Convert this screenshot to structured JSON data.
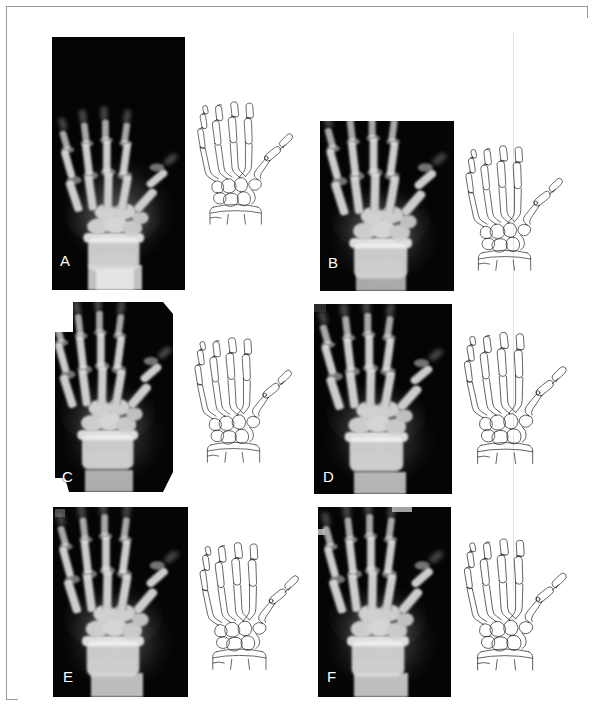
{
  "figure": {
    "kind": "radiograph-tracing-figure",
    "panel_count": 6,
    "background_color": "#ffffff",
    "frame_color": "#9a9a9a",
    "film_color": "#000000",
    "tracing_ink_color": "#1a1a1a",
    "label_color": "#ffffff"
  },
  "panels": [
    {
      "id": "A",
      "label": "A",
      "xray": {
        "x": 45,
        "y": 30,
        "width": 133,
        "height": 253,
        "shape": "rect"
      },
      "tracing": {
        "x": 181,
        "y": 32,
        "width": 110,
        "height": 248
      },
      "label_pos": {
        "x": 53,
        "y": 258
      }
    },
    {
      "id": "B",
      "label": "B",
      "xray": {
        "x": 313,
        "y": 114,
        "width": 134,
        "height": 170,
        "shape": "rect"
      },
      "tracing": {
        "x": 449,
        "y": 112,
        "width": 112,
        "height": 178
      },
      "label_pos": {
        "x": 321,
        "y": 259
      }
    },
    {
      "id": "C",
      "label": "C",
      "xray": {
        "x": 44,
        "y": 295,
        "width": 129,
        "height": 190,
        "shape": "notched-polygon"
      },
      "tracing": {
        "x": 178,
        "y": 307,
        "width": 112,
        "height": 172
      },
      "label_pos": {
        "x": 55,
        "y": 462
      }
    },
    {
      "id": "D",
      "label": "D",
      "xray": {
        "x": 307,
        "y": 297,
        "width": 138,
        "height": 190,
        "shape": "rect"
      },
      "tracing": {
        "x": 447,
        "y": 300,
        "width": 118,
        "height": 182
      },
      "label_pos": {
        "x": 316,
        "y": 462
      }
    },
    {
      "id": "E",
      "label": "E",
      "xray": {
        "x": 46,
        "y": 500,
        "width": 135,
        "height": 190,
        "shape": "rect"
      },
      "tracing": {
        "x": 183,
        "y": 508,
        "width": 114,
        "height": 182
      },
      "label_pos": {
        "x": 56,
        "y": 662
      }
    },
    {
      "id": "F",
      "label": "F",
      "xray": {
        "x": 311,
        "y": 500,
        "width": 133,
        "height": 190,
        "shape": "rect"
      },
      "tracing": {
        "x": 447,
        "y": 505,
        "width": 118,
        "height": 185
      },
      "label_pos": {
        "x": 320,
        "y": 662
      }
    }
  ],
  "anatomy": {
    "structures": [
      "distal phalanges",
      "middle phalanges",
      "proximal phalanges",
      "metacarpals",
      "carpal bones",
      "distal radius",
      "distal ulna",
      "sesamoid bone"
    ],
    "digits": [
      "thumb",
      "index",
      "middle",
      "ring",
      "little"
    ],
    "view": "posteroanterior"
  }
}
